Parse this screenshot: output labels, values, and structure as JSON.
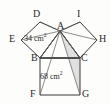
{
  "figure": {
    "background_color": "#fdfdfc",
    "stroke_color": "#3a3a3a",
    "shade_color": "#c9c9c9",
    "vertices": [
      {
        "id": "D",
        "label": "D",
        "x": 40,
        "y": 22,
        "label_x": 33,
        "label_y": 9
      },
      {
        "id": "I",
        "label": "I",
        "x": 80,
        "y": 22,
        "label_x": 76,
        "label_y": 9
      },
      {
        "id": "E",
        "label": "E",
        "x": 21,
        "y": 40,
        "label_x": 8,
        "label_y": 34
      },
      {
        "id": "H",
        "label": "H",
        "x": 97,
        "y": 40,
        "label_x": 99,
        "label_y": 34
      },
      {
        "id": "A",
        "label": "A",
        "x": 60,
        "y": 31,
        "label_x": 57,
        "label_y": 22
      },
      {
        "id": "B",
        "label": "B",
        "x": 40,
        "y": 58,
        "label_x": 30,
        "label_y": 54
      },
      {
        "id": "C",
        "label": "C",
        "x": 80,
        "y": 58,
        "label_x": 80,
        "label_y": 54
      },
      {
        "id": "F",
        "label": "F",
        "x": 40,
        "y": 95,
        "label_x": 30,
        "label_y": 90
      },
      {
        "id": "G",
        "label": "G",
        "x": 80,
        "y": 95,
        "label_x": 81,
        "label_y": 90
      }
    ],
    "area_labels": [
      {
        "id": "left-square-area",
        "value": "34",
        "unit": "cm",
        "exponent": "2",
        "x": 24,
        "y": 35
      },
      {
        "id": "bottom-square-area",
        "value": "68",
        "unit": "cm",
        "exponent": "2",
        "x": 40,
        "y": 73
      }
    ],
    "shapes": {
      "left_square": "D E B A",
      "right_square": "A I H C",
      "bottom_square": "B C G F",
      "triangle": "A B C",
      "shaded_region": "A C G"
    }
  }
}
